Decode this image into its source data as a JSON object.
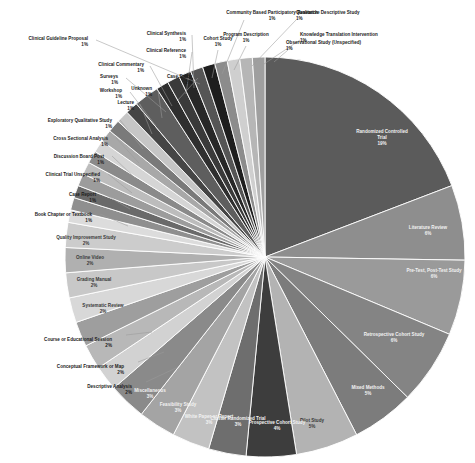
{
  "chart": {
    "type": "pie",
    "title": "",
    "start_angle_deg": 90,
    "direction": "clockwise",
    "center": {
      "x": 265,
      "y": 257
    },
    "radius": 200,
    "background": "#ffffff",
    "label_suffix": "%"
  },
  "chart_data": {
    "type": "pie",
    "title": "",
    "subtitle": "",
    "xlabel": "",
    "ylabel": "",
    "legend_position": "none",
    "grid": false,
    "value_unit": "percent",
    "labels": [
      "Randomized Controlled Trial",
      "Literature Review",
      "Pre-Test, Post-Test Study",
      "Retrospective Cohort Study",
      "Mixed Methods",
      "Pilot Study",
      "Prospective Cohort Study",
      "Cluster Randomized Trial",
      "White Paper or Report",
      "Feasibility Study",
      "Miscellaneous",
      "Descriptive Analysis",
      "Conceptual Framework or Map",
      "Course or Educational Session",
      "Systematic Review",
      "Grading Manual",
      "Online Video",
      "Quality Improvement Study",
      "Book Chapter or Textbook",
      "Case Report",
      "Clinical Trial Unspecified",
      "Discussion Board Post",
      "Cross Sectional Analysis",
      "Exploratory Qualitative Study",
      "Lecture",
      "Workshop",
      "Unknown",
      "Surveys",
      "Clinical Commentary",
      "Case Study",
      "Clinical Reference",
      "Clinical Synthesis",
      "Clinical Guideline Proposal",
      "Cohort Study",
      "Community Based Participatory Research",
      "Program Description",
      "Qualitative Descriptive Study",
      "Knowledge Translation Intervention",
      "Observational Study (Unspecified)"
    ],
    "values": [
      19,
      6,
      6,
      6,
      5,
      5,
      4,
      3,
      3,
      3,
      3,
      2,
      2,
      2,
      2,
      2,
      2,
      2,
      1,
      1,
      1,
      1,
      1,
      1,
      1,
      1,
      1,
      1,
      1,
      2,
      1,
      1,
      1,
      1,
      1,
      1,
      1,
      1,
      1
    ],
    "value_labels": [
      "19%",
      "6%",
      "6%",
      "6%",
      "5%",
      "5%",
      "4%",
      "3%",
      "3%",
      "3%",
      "3%",
      "2%",
      "2%",
      "2%",
      "2%",
      "2%",
      "2%",
      "2%",
      "1%",
      "1%",
      "1%",
      "1%",
      "1%",
      "1%",
      "1%",
      "1%",
      "1%",
      "1%",
      "1%",
      "2%",
      "1%",
      "1%",
      "1%",
      "1%",
      "1%",
      "1%",
      "1%",
      "1%",
      "1%"
    ],
    "colors": [
      "#5b5b5b",
      "#8e8e8e",
      "#9a9a9a",
      "#848484",
      "#7c7c7c",
      "#b3b3b3",
      "#3d3d3d",
      "#6e6e6e",
      "#c2c2c2",
      "#a4a4a4",
      "#8a8a8a",
      "#d2d2d2",
      "#b8b8b8",
      "#9e9e9e",
      "#d8d8d8",
      "#c8c8c8",
      "#b0b0b0",
      "#cccccc",
      "#dcdcdc",
      "#8f8f8f",
      "#6a6a6a",
      "#9c9c9c",
      "#bcbcbc",
      "#8a8a8a",
      "#d5d5d5",
      "#a8a8a8",
      "#7a7a7a",
      "#c6c6c6",
      "#454545",
      "#5e5e5e",
      "#2f2f2f",
      "#3a3a3a",
      "#272727",
      "#555555",
      "#1e1e1e",
      "#8c8c8c",
      "#cfcfcf",
      "#b6b6b6",
      "#9f9f9f"
    ]
  },
  "slices": [
    {
      "label": "Randomized Controlled Trial",
      "value_label": "19%",
      "placement": "inside"
    },
    {
      "label": "Literature Review",
      "value_label": "6%",
      "placement": "inside"
    },
    {
      "label": "Pre-Test, Post-Test Study",
      "value_label": "6%",
      "placement": "inside"
    },
    {
      "label": "Retrospective Cohort Study",
      "value_label": "6%",
      "placement": "inside"
    },
    {
      "label": "Mixed Methods",
      "value_label": "5%",
      "placement": "inside"
    },
    {
      "label": "Pilot Study",
      "value_label": "5%",
      "placement": "inside"
    },
    {
      "label": "Prospective Cohort Study",
      "value_label": "4%",
      "placement": "inside"
    },
    {
      "label": "Cluster Randomized Trial",
      "value_label": "3%",
      "placement": "inside"
    },
    {
      "label": "White Paper or Report",
      "value_label": "3%",
      "placement": "inside"
    },
    {
      "label": "Feasibility Study",
      "value_label": "3%",
      "placement": "inside"
    },
    {
      "label": "Miscellaneous",
      "value_label": "3%",
      "placement": "inside"
    },
    {
      "label": "Descriptive Analysis",
      "value_label": "2%",
      "placement": "outside"
    },
    {
      "label": "Conceptual Framework or Map",
      "value_label": "2%",
      "placement": "outside"
    },
    {
      "label": "Course or Educational Session",
      "value_label": "2%",
      "placement": "outside"
    },
    {
      "label": "Systematic Review",
      "value_label": "2%",
      "placement": "inside"
    },
    {
      "label": "Grading Manual",
      "value_label": "2%",
      "placement": "inside"
    },
    {
      "label": "Online Video",
      "value_label": "2%",
      "placement": "inside"
    },
    {
      "label": "Quality Improvement Study",
      "value_label": "2%",
      "placement": "inside"
    },
    {
      "label": "Book Chapter or Textbook",
      "value_label": "1%",
      "placement": "outside"
    },
    {
      "label": "Case Report",
      "value_label": "1%",
      "placement": "outside"
    },
    {
      "label": "Clinical Trial Unspecified",
      "value_label": "1%",
      "placement": "outside"
    },
    {
      "label": "Discussion Board Post",
      "value_label": "1%",
      "placement": "outside"
    },
    {
      "label": "Cross Sectional Analysis",
      "value_label": "1%",
      "placement": "outside"
    },
    {
      "label": "Exploratory Qualitative Study",
      "value_label": "1%",
      "placement": "outside"
    },
    {
      "label": "Lecture",
      "value_label": "1%",
      "placement": "outside"
    },
    {
      "label": "Workshop",
      "value_label": "1%",
      "placement": "outside"
    },
    {
      "label": "Unknown",
      "value_label": "1%",
      "placement": "outside"
    },
    {
      "label": "Surveys",
      "value_label": "1%",
      "placement": "outside"
    },
    {
      "label": "Clinical Commentary",
      "value_label": "1%",
      "placement": "outside"
    },
    {
      "label": "Case Study",
      "value_label": "2%",
      "placement": "outside"
    },
    {
      "label": "Clinical Reference",
      "value_label": "1%",
      "placement": "outside"
    },
    {
      "label": "Clinical Synthesis",
      "value_label": "1%",
      "placement": "outside"
    },
    {
      "label": "Clinical Guideline Proposal",
      "value_label": "1%",
      "placement": "outside"
    },
    {
      "label": "Cohort Study",
      "value_label": "1%",
      "placement": "outside"
    },
    {
      "label": "Community Based Participatory Research",
      "value_label": "1%",
      "placement": "outside"
    },
    {
      "label": "Program Description",
      "value_label": "1%",
      "placement": "outside"
    },
    {
      "label": "Qualitative Descriptive Study",
      "value_label": "1%",
      "placement": "outside"
    },
    {
      "label": "Knowledge Translation Intervention",
      "value_label": "1%",
      "placement": "outside"
    },
    {
      "label": "Observational Study (Unspecified)",
      "value_label": "1%",
      "placement": "outside"
    }
  ],
  "label_layout": {
    "Descriptive Analysis": {
      "x": 132,
      "y": 388,
      "anchor": "end",
      "lx": 146,
      "ly": 382,
      "tx": 176,
      "ty": 368
    },
    "Conceptual Framework or Map": {
      "x": 124,
      "y": 368,
      "anchor": "end",
      "lx": 138,
      "ly": 362,
      "tx": 164,
      "ty": 352
    },
    "Course or Educational Session": {
      "x": 112,
      "y": 341,
      "anchor": "end",
      "lx": 126,
      "ly": 335,
      "tx": 152,
      "ty": 332
    },
    "Book Chapter or Textbook": {
      "x": 92,
      "y": 216,
      "anchor": "end",
      "lx": 100,
      "ly": 214,
      "tx": 128,
      "ty": 226
    },
    "Case Report": {
      "x": 96,
      "y": 196,
      "anchor": "end",
      "lx": 104,
      "ly": 194,
      "tx": 130,
      "ty": 209
    },
    "Clinical Trial Unspecified": {
      "x": 100,
      "y": 176,
      "anchor": "end",
      "lx": 108,
      "ly": 174,
      "tx": 132,
      "ty": 193
    },
    "Discussion Board Post": {
      "x": 104,
      "y": 158,
      "anchor": "end",
      "lx": 112,
      "ly": 156,
      "tx": 135,
      "ty": 178
    },
    "Cross Sectional Analysis": {
      "x": 108,
      "y": 140,
      "anchor": "end",
      "lx": 116,
      "ly": 138,
      "tx": 139,
      "ty": 163
    },
    "Exploratory Qualitative Study": {
      "x": 112,
      "y": 122,
      "anchor": "end",
      "lx": 120,
      "ly": 120,
      "tx": 143,
      "ty": 149
    },
    "Lecture": {
      "x": 134,
      "y": 104,
      "anchor": "end",
      "lx": 140,
      "ly": 104,
      "tx": 152,
      "ty": 134
    },
    "Workshop": {
      "x": 122,
      "y": 92,
      "anchor": "end",
      "lx": 130,
      "ly": 92,
      "tx": 156,
      "ty": 126
    },
    "Unknown": {
      "x": 152,
      "y": 90,
      "anchor": "end",
      "lx": 158,
      "ly": 90,
      "tx": 162,
      "ty": 118
    },
    "Surveys": {
      "x": 118,
      "y": 78,
      "anchor": "end",
      "lx": 126,
      "ly": 78,
      "tx": 166,
      "ty": 112
    },
    "Clinical Commentary": {
      "x": 144,
      "y": 66,
      "anchor": "end",
      "lx": 150,
      "ly": 66,
      "tx": 172,
      "ty": 106
    },
    "Case Study": {
      "x": 192,
      "y": 78,
      "anchor": "end",
      "lx": 198,
      "ly": 78,
      "tx": 178,
      "ty": 100
    },
    "Clinical Reference": {
      "x": 186,
      "y": 52,
      "anchor": "end",
      "lx": 192,
      "ly": 52,
      "tx": 186,
      "ty": 94
    },
    "Clinical Synthesis": {
      "x": 186,
      "y": 35,
      "anchor": "end",
      "lx": 192,
      "ly": 35,
      "tx": 194,
      "ty": 88
    },
    "Clinical Guideline Proposal": {
      "x": 88,
      "y": 40,
      "anchor": "end",
      "lx": 96,
      "ly": 40,
      "tx": 200,
      "ty": 84
    },
    "Cohort Study": {
      "x": 218,
      "y": 40,
      "anchor": "middle",
      "lx": 218,
      "ly": 50,
      "tx": 212,
      "ty": 78
    },
    "Community Based Participatory Research": {
      "x": 272,
      "y": 14,
      "anchor": "middle",
      "lx": 244,
      "ly": 20,
      "tx": 222,
      "ty": 74
    },
    "Program Description": {
      "x": 246,
      "y": 36,
      "anchor": "middle",
      "lx": 246,
      "ly": 46,
      "tx": 234,
      "ty": 70
    },
    "Qualitative Descriptive Study": {
      "x": 296,
      "y": 14,
      "anchor": "start",
      "lx": 296,
      "ly": 20,
      "tx": 252,
      "ty": 66
    },
    "Knowledge Translation Intervention": {
      "x": 300,
      "y": 36,
      "anchor": "start",
      "lx": 300,
      "ly": 40,
      "tx": 264,
      "ty": 64
    },
    "Observational Study (Unspecified)": {
      "x": 286,
      "y": 44,
      "anchor": "start",
      "lx": 288,
      "ly": 50,
      "tx": 274,
      "ty": 62
    }
  },
  "inside_label_layout": {
    "Randomized Controlled Trial": {
      "x": 382,
      "y": 133,
      "tone": "on-dark"
    },
    "Literature Review": {
      "x": 428,
      "y": 229,
      "tone": "on-dark"
    },
    "Pre-Test, Post-Test Study": {
      "x": 434,
      "y": 272,
      "tone": "on-dark"
    },
    "Retrospective Cohort Study": {
      "x": 394,
      "y": 336,
      "tone": "on-dark"
    },
    "Mixed Methods": {
      "x": 368,
      "y": 389,
      "tone": "on-dark"
    },
    "Pilot Study": {
      "x": 312,
      "y": 422,
      "tone": "on-light"
    },
    "Prospective Cohort Study": {
      "x": 277,
      "y": 424,
      "tone": "on-dark"
    },
    "Cluster Randomized Trial": {
      "x": 238,
      "y": 420,
      "tone": "on-dark"
    },
    "White Paper or Report": {
      "x": 209,
      "y": 418,
      "tone": "on-dark"
    },
    "Feasibility Study": {
      "x": 178,
      "y": 406,
      "tone": "on-dark"
    },
    "Miscellaneous": {
      "x": 150,
      "y": 392,
      "tone": "on-dark"
    },
    "Systematic Review": {
      "x": 103,
      "y": 307,
      "tone": "on-light"
    },
    "Grading Manual": {
      "x": 94,
      "y": 281,
      "tone": "on-light"
    },
    "Online Video": {
      "x": 90,
      "y": 259,
      "tone": "on-light"
    },
    "Quality Improvement Study": {
      "x": 86,
      "y": 239,
      "tone": "on-light"
    }
  }
}
